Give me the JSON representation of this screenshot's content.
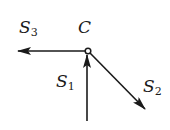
{
  "diagram": {
    "type": "vector-node-diagram",
    "node": {
      "label": "C",
      "x": 88,
      "y": 51,
      "shape": "open-circle"
    },
    "arrows": [
      {
        "id": "S1",
        "label": "S",
        "subscript": "1",
        "direction": "incoming-from-below",
        "from": [
          87,
          121
        ],
        "to": [
          87,
          55
        ]
      },
      {
        "id": "S2",
        "label": "S",
        "subscript": "2",
        "direction": "outgoing-down-right",
        "from": [
          90,
          53
        ],
        "to": [
          145,
          109
        ]
      },
      {
        "id": "S3",
        "label": "S",
        "subscript": "3",
        "direction": "outgoing-left",
        "from": [
          85,
          51
        ],
        "to": [
          17,
          51
        ]
      }
    ],
    "colors": {
      "stroke": "#1a1a1a",
      "background": "#ffffff"
    }
  }
}
